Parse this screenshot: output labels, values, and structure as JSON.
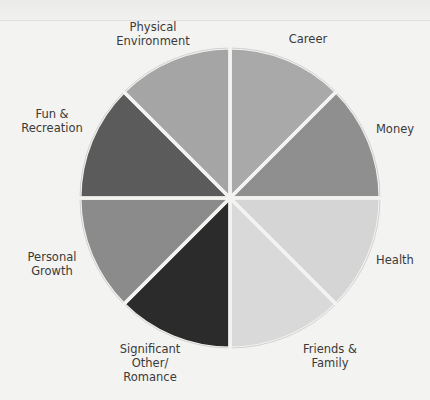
{
  "chart_data": {
    "type": "pie",
    "title": "",
    "categories": [
      "Career",
      "Money",
      "Health",
      "Friends & Family",
      "Significant Other/ Romance",
      "Personal Growth",
      "Fun & Recreation",
      "Physical Environment"
    ],
    "values": [
      12.5,
      12.5,
      12.5,
      12.5,
      12.5,
      12.5,
      12.5,
      12.5
    ],
    "colors": [
      "#a9a9a9",
      "#8f8f8f",
      "#d5d5d5",
      "#d9d9d9",
      "#2b2b2b",
      "#8b8b8b",
      "#5b5b5b",
      "#a5a5a5"
    ],
    "start_angle_deg": 0,
    "direction": "clockwise",
    "legend": "labels placed around slices",
    "grid": false
  },
  "labels": {
    "career": "Career",
    "money": "Money",
    "health": "Health",
    "friends_family": "Friends &\nFamily",
    "significant_other": "Significant\nOther/\nRomance",
    "personal_growth": "Personal\nGrowth",
    "fun_recreation": "Fun &\nRecreation",
    "physical_environment": "Physical\nEnvironment"
  }
}
